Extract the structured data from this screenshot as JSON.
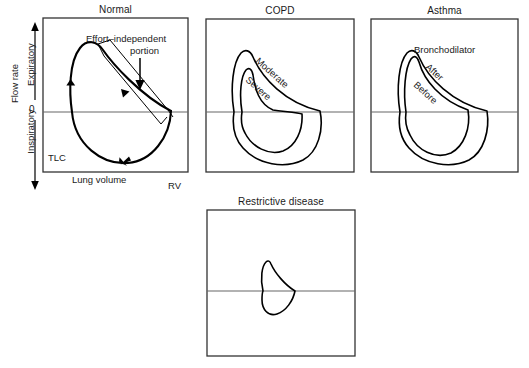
{
  "figure": {
    "kind": "flow-volume-loop-diagram",
    "background_color": "#ffffff",
    "line_color": "#000000",
    "axis_color": "#555555"
  },
  "panels": {
    "normal": {
      "title": "Normal",
      "frame": {
        "x": 43,
        "y": 18,
        "width": 145,
        "height": 154
      },
      "zero_line_y": 112,
      "axes": {
        "y_axis_title": "Flow rate",
        "y_upper_direction": "Expiratory",
        "y_lower_direction": "Inspiratory",
        "y_zero_tick": "0",
        "x_axis_title": "Lung volume",
        "x_left_marker": "TLC",
        "x_right_marker": "RV"
      },
      "annotations": {
        "effort_line_1": "Effort–independent",
        "effort_line_2": "portion"
      }
    },
    "copd": {
      "title": "COPD",
      "frame": {
        "x": 206,
        "y": 19,
        "width": 148,
        "height": 153
      },
      "zero_line_y": 112,
      "curves": [
        {
          "label": "Moderate"
        },
        {
          "label": "Severe"
        }
      ]
    },
    "asthma": {
      "title": "Asthma",
      "frame": {
        "x": 371,
        "y": 19,
        "width": 147,
        "height": 153
      },
      "zero_line_y": 112,
      "annotations": {
        "heading": "Bronchodilator"
      },
      "curves": [
        {
          "label": "After"
        },
        {
          "label": "Before"
        }
      ]
    },
    "restrictive": {
      "title": "Restrictive disease",
      "frame": {
        "x": 207,
        "y": 210,
        "width": 148,
        "height": 146
      },
      "zero_line_y": 291
    }
  }
}
